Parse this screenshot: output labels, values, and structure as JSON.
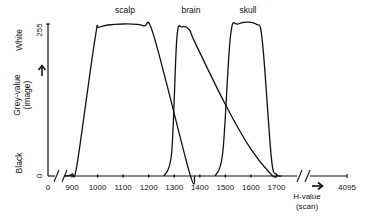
{
  "chart_data": {
    "type": "line",
    "title": "",
    "xlabel": "H-value (scan)",
    "ylabel": "Grey-value (image)",
    "y_axis": {
      "min_label": "Black",
      "max_label": "White",
      "ticks": [
        {
          "value": 0,
          "label": "0"
        },
        {
          "value": 255,
          "label": "255"
        }
      ],
      "ylim": [
        0,
        255
      ]
    },
    "x_axis": {
      "ticks": [
        {
          "value": 0,
          "label": "0"
        },
        {
          "value": 900,
          "label": "900"
        },
        {
          "value": 1000,
          "label": "1000"
        },
        {
          "value": 1100,
          "label": "1100"
        },
        {
          "value": 1200,
          "label": "1200"
        },
        {
          "value": 1300,
          "label": "1300"
        },
        {
          "value": 1400,
          "label": "1400"
        },
        {
          "value": 1500,
          "label": "1500"
        },
        {
          "value": 1600,
          "label": "1600"
        },
        {
          "value": 1700,
          "label": "1700"
        },
        {
          "value": 4095,
          "label": "4095"
        }
      ],
      "breaks": [
        "between 0 and 900",
        "between 1700 and 4095"
      ],
      "visible_range": [
        860,
        1740
      ]
    },
    "grid": false,
    "legend": "none (curves labeled directly)",
    "series": [
      {
        "name": "scalp",
        "points": [
          [
            870,
            0
          ],
          [
            900,
            3
          ],
          [
            920,
            20
          ],
          [
            990,
            230
          ],
          [
            1010,
            250
          ],
          [
            1100,
            255
          ],
          [
            1180,
            252
          ],
          [
            1220,
            235
          ],
          [
            1360,
            5
          ],
          [
            1380,
            0
          ]
        ]
      },
      {
        "name": "brain",
        "points": [
          [
            1260,
            0
          ],
          [
            1290,
            40
          ],
          [
            1310,
            230
          ],
          [
            1330,
            250
          ],
          [
            1360,
            245
          ],
          [
            1380,
            225
          ],
          [
            1500,
            120
          ],
          [
            1600,
            45
          ],
          [
            1680,
            2
          ],
          [
            1700,
            0
          ]
        ]
      },
      {
        "name": "skull",
        "points": [
          [
            1460,
            0
          ],
          [
            1490,
            40
          ],
          [
            1520,
            235
          ],
          [
            1550,
            255
          ],
          [
            1620,
            255
          ],
          [
            1645,
            225
          ],
          [
            1680,
            30
          ],
          [
            1700,
            3
          ],
          [
            1720,
            0
          ]
        ]
      }
    ]
  }
}
